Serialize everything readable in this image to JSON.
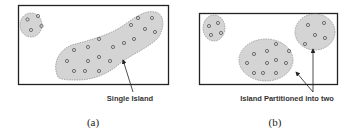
{
  "figure": {
    "panels": [
      {
        "id": "a",
        "caption": "(a)",
        "annotation": "Single Island",
        "description": "One large connected island plus a small separate cluster"
      },
      {
        "id": "b",
        "caption": "(b)",
        "annotation": "Island Partitioned into two",
        "description": "Large island split into two islands plus the small cluster"
      }
    ],
    "colors": {
      "island_fill": "#d4d4d4",
      "island_stroke": "#888888",
      "frame_stroke": "#222222",
      "node_stroke": "#555555"
    }
  }
}
